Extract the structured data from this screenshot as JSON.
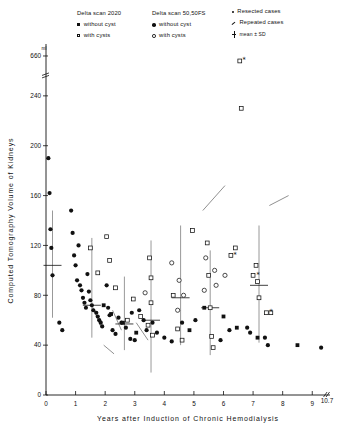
{
  "legend": {
    "groups": [
      {
        "title": "Delta scan 2020",
        "items": [
          {
            "marker": "filled-square",
            "label": "without cyst"
          },
          {
            "marker": "open-square",
            "label": "with cysts"
          }
        ]
      },
      {
        "title": "Delta scan 50,50FS",
        "items": [
          {
            "marker": "filled-circle",
            "label": "without cyst"
          },
          {
            "marker": "open-circle",
            "label": "with cysts"
          }
        ]
      }
    ],
    "symbols": [
      {
        "marker": "small-dot",
        "label": "Resected cases"
      },
      {
        "marker": "slash",
        "label": "Repeated cases"
      },
      {
        "marker": "error-bar",
        "label": "mean ± SD"
      }
    ]
  },
  "chart_data": {
    "type": "scatter",
    "title": "",
    "xlabel": "Years after Induction of Chronic Hemodialysis",
    "ylabel": "Computed Tomography  Volume of  Kidneys",
    "yunit": "ml",
    "xlim": [
      0,
      9.6
    ],
    "ylim": [
      0,
      280
    ],
    "xticks": [
      0,
      1,
      2,
      3,
      4,
      5,
      6,
      7,
      8,
      9
    ],
    "xticklabels": [
      "0",
      "1",
      "2",
      "3",
      "4",
      "5",
      "6",
      "7",
      "8",
      "9"
    ],
    "x_extra_tick": {
      "value": 9.45,
      "label": "10.7"
    },
    "yticks": [
      0,
      40,
      80,
      120,
      160,
      200,
      240
    ],
    "yticklabels": [
      "0",
      "40",
      "80",
      "120",
      "160",
      "200",
      "240"
    ],
    "y_break": {
      "at": 258,
      "label": "660",
      "value": 660
    },
    "grid": false,
    "legend_position": "top",
    "series": [
      {
        "name": "Delta scan 2020 without cyst",
        "marker": "filled-square",
        "points": [
          [
            1.95,
            72
          ],
          [
            2.6,
            58
          ],
          [
            3.05,
            50
          ],
          [
            5.35,
            70
          ],
          [
            6.0,
            63
          ],
          [
            6.45,
            54
          ],
          [
            7.15,
            46
          ],
          [
            8.5,
            40
          ],
          [
            2.2,
            65
          ],
          [
            4.85,
            52
          ]
        ]
      },
      {
        "name": "Delta scan 2020 with cysts",
        "marker": "open-square",
        "points": [
          [
            1.5,
            118
          ],
          [
            2.15,
            108
          ],
          [
            2.35,
            86
          ],
          [
            2.95,
            77
          ],
          [
            3.2,
            63
          ],
          [
            3.45,
            56
          ],
          [
            3.55,
            94
          ],
          [
            3.5,
            110
          ],
          [
            3.55,
            74
          ],
          [
            3.6,
            48
          ],
          [
            4.3,
            80
          ],
          [
            4.45,
            53
          ],
          [
            4.6,
            44
          ],
          [
            5.45,
            122
          ],
          [
            5.5,
            96
          ],
          [
            5.55,
            70
          ],
          [
            5.6,
            47
          ],
          [
            5.65,
            38
          ],
          [
            6.4,
            118
          ],
          [
            7.1,
            104
          ],
          [
            7.15,
            91
          ],
          [
            7.2,
            78
          ],
          [
            7.6,
            66
          ],
          [
            2.05,
            127
          ],
          [
            4.95,
            132
          ],
          [
            6.6,
            230
          ],
          [
            2.75,
            60
          ],
          [
            1.75,
            98
          ]
        ]
      },
      {
        "name": "Delta scan 50,50FS without cyst",
        "marker": "filled-circle",
        "points": [
          [
            0.08,
            190
          ],
          [
            0.12,
            162
          ],
          [
            0.15,
            133
          ],
          [
            0.18,
            118
          ],
          [
            0.22,
            96
          ],
          [
            0.85,
            148
          ],
          [
            0.9,
            130
          ],
          [
            0.95,
            112
          ],
          [
            1.0,
            104
          ],
          [
            1.05,
            92
          ],
          [
            1.15,
            88
          ],
          [
            1.2,
            84
          ],
          [
            1.25,
            78
          ],
          [
            1.3,
            74
          ],
          [
            1.35,
            70
          ],
          [
            1.4,
            97
          ],
          [
            1.45,
            83
          ],
          [
            1.5,
            76
          ],
          [
            1.55,
            72
          ],
          [
            1.6,
            68
          ],
          [
            1.7,
            66
          ],
          [
            1.75,
            63
          ],
          [
            1.8,
            60
          ],
          [
            1.85,
            58
          ],
          [
            1.9,
            55
          ],
          [
            2.05,
            88
          ],
          [
            2.1,
            70
          ],
          [
            2.15,
            64
          ],
          [
            2.25,
            52
          ],
          [
            2.35,
            49
          ],
          [
            2.45,
            62
          ],
          [
            2.55,
            58
          ],
          [
            2.7,
            54
          ],
          [
            2.85,
            45
          ],
          [
            3.0,
            44
          ],
          [
            3.15,
            68
          ],
          [
            3.3,
            60
          ],
          [
            3.4,
            52
          ],
          [
            3.6,
            58
          ],
          [
            3.75,
            50
          ],
          [
            4.0,
            46
          ],
          [
            4.25,
            43
          ],
          [
            4.6,
            58
          ],
          [
            5.05,
            60
          ],
          [
            5.9,
            44
          ],
          [
            6.2,
            52
          ],
          [
            6.8,
            54
          ],
          [
            6.9,
            50
          ],
          [
            7.4,
            46
          ],
          [
            7.5,
            40
          ],
          [
            9.3,
            38
          ],
          [
            0.45,
            58
          ],
          [
            0.55,
            52
          ],
          [
            1.1,
            120
          ],
          [
            2.9,
            66
          ]
        ]
      },
      {
        "name": "Delta scan 50,50FS with cysts",
        "marker": "open-circle",
        "points": [
          [
            4.25,
            106
          ],
          [
            4.5,
            92
          ],
          [
            4.65,
            80
          ],
          [
            5.4,
            110
          ],
          [
            5.7,
            100
          ],
          [
            5.75,
            88
          ],
          [
            5.35,
            84
          ],
          [
            4.45,
            68
          ],
          [
            6.05,
            96
          ],
          [
            3.35,
            82
          ]
        ]
      }
    ],
    "resected_cases": [
      {
        "x": 6.55,
        "y": 268,
        "marker": "open-square"
      },
      {
        "x": 6.25,
        "y": 112,
        "marker": "open-square"
      },
      {
        "x": 7.0,
        "y": 96,
        "marker": "open-square"
      },
      {
        "x": 7.45,
        "y": 66,
        "marker": "open-square"
      }
    ],
    "repeated_cases": [
      {
        "from": [
          5.3,
          148
        ],
        "to": [
          6.05,
          168
        ]
      },
      {
        "from": [
          7.55,
          152
        ],
        "to": [
          8.2,
          160
        ]
      },
      {
        "from": [
          1.55,
          72
        ],
        "to": [
          1.85,
          55
        ]
      },
      {
        "from": [
          2.25,
          68
        ],
        "to": [
          2.55,
          52
        ]
      },
      {
        "from": [
          3.05,
          58
        ],
        "to": [
          3.45,
          44
        ]
      },
      {
        "from": [
          1.95,
          40
        ],
        "to": [
          2.3,
          33
        ]
      }
    ],
    "mean_sd_bars": [
      {
        "x": 0.22,
        "mean": 104,
        "lo": 62,
        "hi": 148
      },
      {
        "x": 1.55,
        "mean": 72,
        "lo": 46,
        "hi": 126
      },
      {
        "x": 2.65,
        "mean": 57,
        "lo": 36,
        "hi": 95
      },
      {
        "x": 3.55,
        "mean": 60,
        "lo": 18,
        "hi": 124
      },
      {
        "x": 4.55,
        "mean": 78,
        "lo": 40,
        "hi": 136
      },
      {
        "x": 5.55,
        "mean": 70,
        "lo": 32,
        "hi": 116
      },
      {
        "x": 7.2,
        "mean": 88,
        "lo": 42,
        "hi": 136
      }
    ]
  }
}
